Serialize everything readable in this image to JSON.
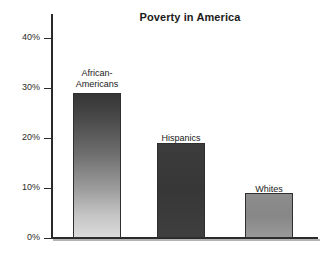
{
  "chart_data": {
    "type": "bar",
    "title": "Poverty in America",
    "xlabel": "",
    "ylabel": "",
    "categories": [
      "African-\nAmericans",
      "Hispanics",
      "Whites"
    ],
    "values": [
      29,
      19,
      9
    ],
    "ylim": [
      0,
      42
    ],
    "yticks": [
      0,
      10,
      20,
      30,
      40
    ],
    "ytick_labels": [
      "0%",
      "10%",
      "20%",
      "30%",
      "40%"
    ],
    "grid": false,
    "legend": "none",
    "series": [
      {
        "name": "Poverty rate",
        "values": [
          29,
          19,
          9
        ]
      }
    ],
    "bars": [
      {
        "label": "African-\nAmericans",
        "value": 29,
        "value_label": "29%",
        "fill": "gradient-dark-to-light",
        "color_top": "#343434",
        "color_bottom": "#dcdcdc"
      },
      {
        "label": "Hispanics",
        "value": 19,
        "value_label": "19%",
        "fill": "solid-dark",
        "color_top": "#3c3c3c",
        "color_bottom": "#3f3f3f"
      },
      {
        "label": "Whites",
        "value": 9,
        "value_label": "9%",
        "fill": "solid-mid-gray",
        "color_top": "#8d8d8d",
        "color_bottom": "#9a9a9a"
      }
    ],
    "colors": {
      "axis": "#2a2a2a",
      "title": "#1b1b1b",
      "tick_label": "#2b2b2b",
      "bar_outline": "#2f2f2f",
      "background": "#ffffff"
    }
  }
}
